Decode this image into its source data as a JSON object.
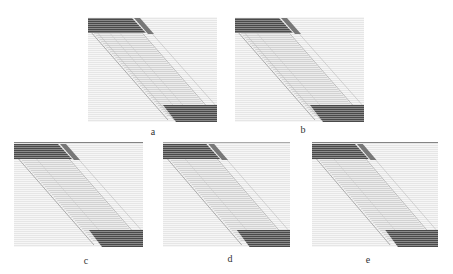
{
  "figure": {
    "panels": [
      {
        "id": "a",
        "label": "a"
      },
      {
        "id": "b",
        "label": "b"
      },
      {
        "id": "c",
        "label": "c"
      },
      {
        "id": "d",
        "label": "d"
      },
      {
        "id": "e",
        "label": "e"
      }
    ]
  },
  "colors": {
    "background": "#ffffff",
    "dark_band": "#555555",
    "light_band": "#dcdcdc",
    "panel_bg": "#f2f2f2"
  }
}
